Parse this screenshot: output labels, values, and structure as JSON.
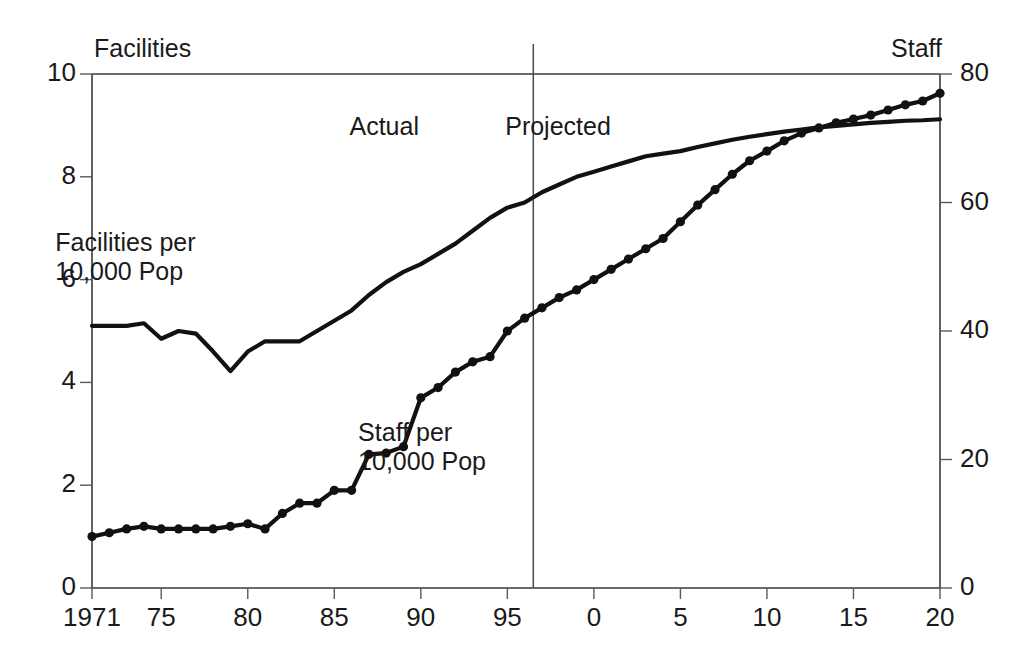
{
  "chart_data": {
    "type": "line",
    "title": "",
    "subtitle": "",
    "xlabel": "",
    "ylabel": "Facilities per 10,000 Pop",
    "y2label": "Staff per 10,000 Pop",
    "grid": false,
    "legend_position": "inline-annotations",
    "x": [
      1971,
      1972,
      1973,
      1974,
      1975,
      1976,
      1977,
      1978,
      1979,
      1980,
      1981,
      1982,
      1983,
      1984,
      1985,
      1986,
      1987,
      1988,
      1989,
      1990,
      1991,
      1992,
      1993,
      1994,
      1995,
      1996,
      1997,
      1998,
      1999,
      2000,
      2001,
      2002,
      2003,
      2004,
      2005,
      2006,
      2007,
      2008,
      2009,
      2010,
      2011,
      2012,
      2013,
      2014,
      2015,
      2016,
      2017,
      2018,
      2019,
      2020
    ],
    "xlim": [
      1971,
      2020
    ],
    "ylim": [
      0,
      10
    ],
    "y2lim": [
      0,
      80
    ],
    "xticks": [
      1971,
      1975,
      1980,
      1985,
      1990,
      1995,
      2000,
      2005,
      2010,
      2015,
      2020
    ],
    "xticklabels": [
      "1971",
      "75",
      "80",
      "85",
      "90",
      "95",
      "0",
      "5",
      "10",
      "15",
      "20"
    ],
    "yticks": [
      0,
      2,
      4,
      6,
      8,
      10
    ],
    "yticklabels": [
      "0",
      "2",
      "4",
      "6",
      "8",
      "10"
    ],
    "y2ticks": [
      0,
      20,
      40,
      60,
      80
    ],
    "y2ticklabels": [
      "0",
      "20",
      "40",
      "60",
      "80"
    ],
    "axis_corner_labels": {
      "top_left": "Facilities",
      "top_right": "Staff"
    },
    "annotations": [
      {
        "text": "Actual",
        "x": 1990.5,
        "y": 8.95
      },
      {
        "text": "Projected",
        "x": 1999.5,
        "y": 8.95
      },
      {
        "text": "Facilities per\n10,000 Pop",
        "x": 1973.5,
        "y": 6.7
      },
      {
        "text": "Staff per\n10,000 Pop",
        "x": 1991.0,
        "y": 3.0
      }
    ],
    "divider": {
      "x": 1996.5,
      "label_left": "Actual",
      "label_right": "Projected"
    },
    "series": [
      {
        "name": "Facilities per 10,000 Pop",
        "axis": "left",
        "markers": false,
        "values": [
          5.1,
          5.1,
          5.1,
          5.15,
          4.85,
          5.0,
          4.95,
          4.6,
          4.22,
          4.6,
          4.8,
          4.8,
          4.8,
          5.0,
          5.2,
          5.4,
          5.7,
          5.95,
          6.15,
          6.3,
          6.5,
          6.7,
          6.95,
          7.2,
          7.4,
          7.5,
          7.7,
          7.85,
          8.0,
          8.1,
          8.2,
          8.3,
          8.4,
          8.45,
          8.5,
          8.58,
          8.65,
          8.72,
          8.78,
          8.83,
          8.88,
          8.92,
          8.96,
          8.99,
          9.02,
          9.05,
          9.07,
          9.09,
          9.1,
          9.12
        ]
      },
      {
        "name": "Staff per 10,000 Pop",
        "axis": "right",
        "markers": true,
        "values": [
          8.0,
          8.6,
          9.2,
          9.6,
          9.2,
          9.2,
          9.2,
          9.2,
          9.6,
          10.0,
          9.2,
          11.6,
          13.2,
          13.2,
          15.2,
          15.2,
          20.8,
          21.0,
          22.0,
          29.6,
          31.2,
          33.6,
          35.2,
          36.0,
          40.0,
          42.0,
          43.6,
          45.2,
          46.4,
          48.0,
          49.6,
          51.2,
          52.8,
          54.4,
          57.0,
          59.6,
          62.0,
          64.4,
          66.5,
          68.0,
          69.6,
          70.8,
          71.6,
          72.4,
          73.0,
          73.6,
          74.4,
          75.2,
          75.8,
          77.0
        ]
      }
    ]
  }
}
